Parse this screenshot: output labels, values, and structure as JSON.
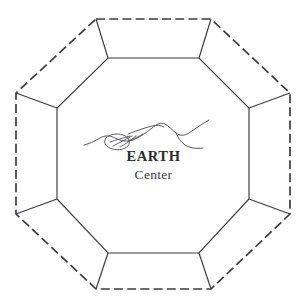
{
  "diagram": {
    "type": "nested-octagon",
    "background_color": "#ffffff",
    "stroke_color": "#3a3a42",
    "outer_octagon": {
      "name": "outer-octagon",
      "style": "dashed",
      "stroke_width": 1.6,
      "dash_pattern": "9 4",
      "vertices": [
        {
          "x": 96,
          "y": 19
        },
        {
          "x": 211,
          "y": 19
        },
        {
          "x": 290,
          "y": 93
        },
        {
          "x": 290,
          "y": 214
        },
        {
          "x": 211,
          "y": 289
        },
        {
          "x": 96,
          "y": 289
        },
        {
          "x": 16,
          "y": 214
        },
        {
          "x": 16,
          "y": 93
        }
      ]
    },
    "inner_octagon": {
      "name": "inner-octagon",
      "style": "solid",
      "stroke_width": 1.1,
      "vertices": [
        {
          "x": 108,
          "y": 58
        },
        {
          "x": 199,
          "y": 58
        },
        {
          "x": 249,
          "y": 108
        },
        {
          "x": 249,
          "y": 199
        },
        {
          "x": 199,
          "y": 253
        },
        {
          "x": 108,
          "y": 253
        },
        {
          "x": 57,
          "y": 199
        },
        {
          "x": 57,
          "y": 108
        }
      ]
    },
    "connectors": {
      "name": "radial-connectors",
      "style": "solid",
      "stroke_width": 1.1,
      "count": 8
    },
    "sketch": {
      "name": "landscape-sketch",
      "description": "hand-drawn horizon landscape with hills",
      "stroke_color": "#4a4a52"
    },
    "labels": {
      "primary": "EARTH",
      "secondary": "Center"
    }
  }
}
